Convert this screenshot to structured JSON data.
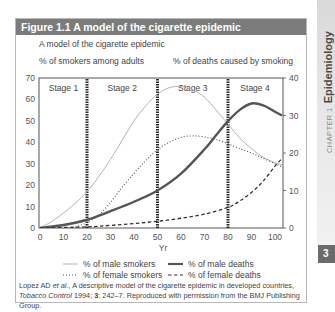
{
  "figure": {
    "title": "Figure 1.1  A model of the cigarette epidemic",
    "subtitle": "A model of the cigarette epidemic",
    "caption": {
      "p1": "Lopez AD ",
      "p2": "et al.",
      "p3": ", A descriptive model of the cigarette epidemic in developed countries, ",
      "p4": "Tobacco Control",
      "p5": " 1994; ",
      "p6": "3",
      "p7": ": 242–7. Reproduced with permission from the BMJ Publishing Group."
    }
  },
  "sidebar": {
    "chapter": "CHAPTER 1",
    "title": "Epidemiology",
    "page_number": "3"
  },
  "chart_data": {
    "type": "line",
    "title": "A model of the cigarette epidemic",
    "xlabel": "Yr",
    "ylabel_left": "% of smokers among adults",
    "ylabel_right": "% of deaths caused by smoking",
    "xlim": [
      0,
      103
    ],
    "ylim_left": [
      0,
      70
    ],
    "ylim_right": [
      0,
      40
    ],
    "x_ticks": [
      0,
      10,
      20,
      30,
      40,
      50,
      60,
      70,
      80,
      90,
      100
    ],
    "y_ticks_left": [
      0,
      10,
      20,
      30,
      40,
      50,
      60,
      70
    ],
    "y_ticks_right": [
      0,
      10,
      20,
      30,
      40
    ],
    "grid": false,
    "stage_boundaries": [
      20,
      50,
      80
    ],
    "stages": [
      {
        "label": "Stage 1",
        "center": 10
      },
      {
        "label": "Stage 2",
        "center": 35
      },
      {
        "label": "Stage 3",
        "center": 65
      },
      {
        "label": "Stage 4",
        "center": 91.5
      }
    ],
    "series": [
      {
        "id": "male_smokers",
        "name": "% of male smokers",
        "axis": "left",
        "color": "#b3b3b3",
        "style": "solid-thin",
        "x": [
          0,
          5,
          10,
          15,
          20,
          25,
          30,
          35,
          40,
          45,
          50,
          55,
          60,
          65,
          70,
          75,
          80,
          85,
          90,
          95,
          100,
          103
        ],
        "y": [
          0,
          3,
          7,
          11.5,
          17,
          24,
          32,
          41,
          50,
          57,
          62.5,
          65.5,
          66,
          64.5,
          61,
          55,
          48.5,
          42,
          37,
          33,
          30.5,
          29.5
        ]
      },
      {
        "id": "female_smokers",
        "name": "% of female smokers",
        "axis": "left",
        "color": "#555555",
        "style": "dotted",
        "x": [
          15,
          20,
          25,
          30,
          35,
          40,
          45,
          50,
          55,
          60,
          65,
          70,
          75,
          80,
          85,
          90,
          95,
          100,
          103
        ],
        "y": [
          0.5,
          2.5,
          6,
          12,
          19,
          25.5,
          31.5,
          36.5,
          40,
          42.3,
          43,
          42.5,
          41.2,
          39.3,
          37,
          35,
          32.5,
          30,
          28.5
        ]
      },
      {
        "id": "male_deaths",
        "name": "% of male deaths",
        "axis": "right",
        "color": "#555555",
        "style": "solid-thick",
        "x": [
          0,
          10,
          20,
          30,
          40,
          50,
          60,
          70,
          75,
          80,
          85,
          90,
          95,
          100,
          103
        ],
        "y": [
          0,
          0.8,
          2.2,
          4.5,
          7,
          10,
          14.5,
          21,
          24.8,
          28.5,
          31.5,
          33.2,
          32.7,
          31,
          30
        ]
      },
      {
        "id": "female_deaths",
        "name": "% of female deaths",
        "axis": "right",
        "color": "#333333",
        "style": "dashed",
        "x": [
          0,
          20,
          30,
          40,
          50,
          60,
          70,
          80,
          85,
          90,
          95,
          100,
          103
        ],
        "y": [
          0,
          0.3,
          0.7,
          1.2,
          1.8,
          2.6,
          3.7,
          5.5,
          7.2,
          9.5,
          12.5,
          16.5,
          18.5
        ]
      }
    ],
    "legend": {
      "position": "bottom",
      "entries": [
        "% of male smokers",
        "% of male deaths",
        "% of female smokers",
        "% of female deaths"
      ]
    }
  }
}
